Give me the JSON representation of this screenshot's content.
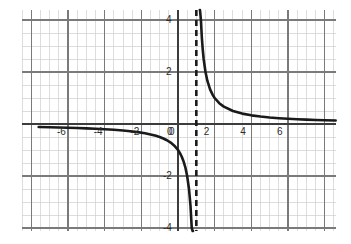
{
  "chart_data": {
    "type": "line",
    "title": "",
    "xlabel": "",
    "ylabel": "",
    "function": "y = 1/(x - 1)",
    "xlim": [
      -7.6,
      8.6
    ],
    "ylim": [
      -5.2,
      5.2
    ],
    "grid": true,
    "grid_major_step": 2,
    "grid_minor_step": 0.5,
    "legend": "none",
    "x_ticks": [
      -6,
      -4,
      -2,
      0,
      2,
      4,
      6
    ],
    "y_ticks": [
      4,
      2,
      0,
      -2,
      -4
    ],
    "x_tick_labels": [
      "-6",
      "-4",
      "-2",
      "0",
      "2",
      "4",
      "6"
    ],
    "y_tick_labels": [
      "4",
      "2",
      "0",
      "-2",
      "-4"
    ],
    "series": [
      {
        "name": "branch-left",
        "style": "solid",
        "color": "#1a1a1a",
        "width": 2.6,
        "points": [
          [
            -7.6,
            -0.116
          ],
          [
            -7.0,
            -0.125
          ],
          [
            -6.5,
            -0.133
          ],
          [
            -6.0,
            -0.143
          ],
          [
            -5.5,
            -0.154
          ],
          [
            -5.0,
            -0.167
          ],
          [
            -4.5,
            -0.182
          ],
          [
            -4.0,
            -0.2
          ],
          [
            -3.5,
            -0.222
          ],
          [
            -3.0,
            -0.25
          ],
          [
            -2.6,
            -0.278
          ],
          [
            -2.2,
            -0.313
          ],
          [
            -1.8,
            -0.357
          ],
          [
            -1.5,
            -0.4
          ],
          [
            -1.2,
            -0.455
          ],
          [
            -1.0,
            -0.5
          ],
          [
            -0.8,
            -0.556
          ],
          [
            -0.6,
            -0.625
          ],
          [
            -0.4,
            -0.714
          ],
          [
            -0.2,
            -0.833
          ],
          [
            0.0,
            -1.0
          ],
          [
            0.1,
            -1.111
          ],
          [
            0.2,
            -1.25
          ],
          [
            0.3,
            -1.429
          ],
          [
            0.4,
            -1.667
          ],
          [
            0.5,
            -2.0
          ],
          [
            0.6,
            -2.5
          ],
          [
            0.68,
            -3.125
          ],
          [
            0.75,
            -4.0
          ],
          [
            0.8,
            -5.0
          ],
          [
            0.82,
            -5.2
          ]
        ]
      },
      {
        "name": "branch-right",
        "style": "solid",
        "color": "#1a1a1a",
        "width": 2.6,
        "points": [
          [
            1.19,
            5.2
          ],
          [
            1.2,
            5.0
          ],
          [
            1.25,
            4.0
          ],
          [
            1.3,
            3.333
          ],
          [
            1.35,
            2.857
          ],
          [
            1.4,
            2.5
          ],
          [
            1.5,
            2.0
          ],
          [
            1.6,
            1.667
          ],
          [
            1.75,
            1.333
          ],
          [
            1.9,
            1.111
          ],
          [
            2.0,
            1.0
          ],
          [
            2.25,
            0.8
          ],
          [
            2.5,
            0.667
          ],
          [
            3.0,
            0.5
          ],
          [
            3.5,
            0.4
          ],
          [
            4.0,
            0.333
          ],
          [
            4.5,
            0.286
          ],
          [
            5.0,
            0.25
          ],
          [
            5.5,
            0.222
          ],
          [
            6.0,
            0.2
          ],
          [
            6.5,
            0.182
          ],
          [
            7.0,
            0.167
          ],
          [
            7.5,
            0.154
          ],
          [
            8.0,
            0.143
          ],
          [
            8.6,
            0.132
          ]
        ]
      }
    ],
    "asymptotes": [
      {
        "name": "vertical-asymptote",
        "orientation": "vertical",
        "value": 1,
        "style": "dashed",
        "color": "#1a1a1a",
        "width": 2.6
      }
    ],
    "axes": {
      "x_axis_value": 0,
      "y_axis_value": 0,
      "color": "#3c3c3c"
    }
  }
}
